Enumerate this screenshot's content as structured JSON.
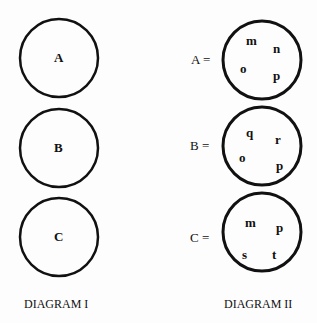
{
  "diagram1": {
    "title": "DIAGRAM I",
    "circles": [
      {
        "label": "A"
      },
      {
        "label": "B"
      },
      {
        "label": "C"
      }
    ]
  },
  "diagram2": {
    "title": "DIAGRAM II",
    "sets": [
      {
        "label": "A =",
        "elements": [
          "m",
          "n",
          "o",
          "p"
        ]
      },
      {
        "label": "B =",
        "elements": [
          "q",
          "r",
          "o",
          "p"
        ]
      },
      {
        "label": "C =",
        "elements": [
          "m",
          "p",
          "s",
          "t"
        ]
      }
    ]
  },
  "colors": {
    "stroke": "#111111",
    "background": "#fdfdfd"
  }
}
